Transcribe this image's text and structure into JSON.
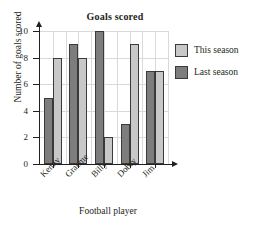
{
  "chart_data": {
    "type": "bar",
    "title": "Goals scored",
    "xlabel": "Football player",
    "ylabel": "Number of goals scored",
    "categories": [
      "Kenny",
      "Graeme",
      "Billy",
      "Dobry",
      "Jim"
    ],
    "series": [
      {
        "name": "Last season",
        "color": "#7d7d7d",
        "values": [
          5,
          9,
          10,
          3,
          7
        ]
      },
      {
        "name": "This season",
        "color": "#c8c8c8",
        "values": [
          8,
          8,
          2,
          9,
          7
        ]
      }
    ],
    "yticks": [
      0,
      2,
      4,
      6,
      8,
      10
    ],
    "ylim": [
      0,
      10
    ],
    "grid": true,
    "legend_position": "right",
    "legend_order": [
      "This season",
      "Last season"
    ]
  },
  "legend": {
    "items": [
      {
        "label": "This season",
        "swatch": "light"
      },
      {
        "label": "Last season",
        "swatch": "dark"
      }
    ]
  },
  "axis": {
    "y_title": "Number of goals scored",
    "x_title": "Football player",
    "tick_0": "0",
    "tick_2": "2",
    "tick_4": "4",
    "tick_6": "6",
    "tick_8": "8",
    "tick_10": "10"
  }
}
